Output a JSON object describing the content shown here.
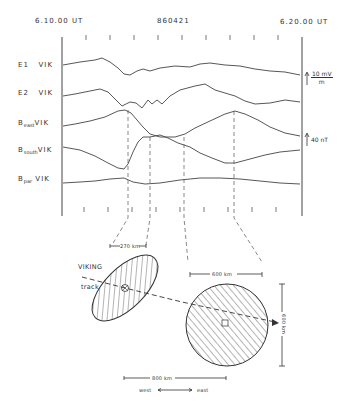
{
  "header": {
    "start_time": "6.10.00 UT",
    "date_code": "860421",
    "end_time": "6.20.00 UT"
  },
  "traces": [
    {
      "name": "E1",
      "suffix": "VIK"
    },
    {
      "name": "E2",
      "suffix": "VIK"
    },
    {
      "name": "B",
      "sub": "east",
      "suffix": "VIK"
    },
    {
      "name": "B",
      "sub": "south",
      "suffix": "VIK"
    },
    {
      "name": "B",
      "sub": "par",
      "suffix": "VIK"
    }
  ],
  "scales": {
    "e_field": {
      "num": "10 mV",
      "den": "m"
    },
    "b_field": "40 nT"
  },
  "diagram": {
    "left_width_label": "270 km",
    "right_width_label": "600 km",
    "right_height_label": "600 km",
    "bottom_width_label": "800 km",
    "track_label_1": "VIKING",
    "track_label_2": "track",
    "dir_west": "west",
    "dir_east": "east"
  },
  "colors": {
    "ink": "#3a3a3a",
    "background": "#ffffff"
  }
}
